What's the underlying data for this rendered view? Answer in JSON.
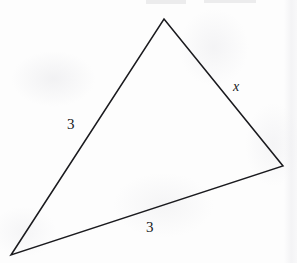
{
  "figure": {
    "kind": "geometry-diagram",
    "shape": "triangle",
    "background_color": "#fdfdfd",
    "stroke_color": "#1a1a1e",
    "stroke_width": 1.5,
    "vertices": {
      "apex": {
        "label": "apex",
        "x": 164,
        "y": 19
      },
      "right": {
        "label": "right",
        "x": 283,
        "y": 166
      },
      "bottom_left": {
        "label": "bottom-left",
        "x": 11,
        "y": 255
      }
    },
    "polygon_points": "164,19 283,166 11,255",
    "labels": {
      "left_side": {
        "text": "3",
        "style": "upright",
        "x": 73,
        "y": 125
      },
      "bottom_side": {
        "text": "3",
        "style": "upright",
        "x": 152,
        "y": 228
      },
      "right_side": {
        "text": "x",
        "style": "italic",
        "x": 239,
        "y": 88
      }
    }
  }
}
